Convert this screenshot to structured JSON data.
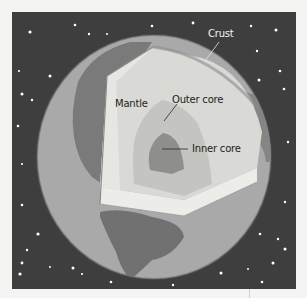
{
  "diagram": {
    "labels": {
      "crust": "Crust",
      "mantle": "Mantle",
      "outer_core": "Outer core",
      "inner_core": "Inner core"
    },
    "colors": {
      "space": "#3e3e3e",
      "ocean": "#a9a9a9",
      "land": "#7a7a7a",
      "crust_edge": "#6f6f6f",
      "mantle": "#d9d9d5",
      "mantle_light": "#e9e9e6",
      "outer_core": "#c4c4c1",
      "inner_core": "#8e8e8c",
      "star": "#ffffff"
    }
  }
}
